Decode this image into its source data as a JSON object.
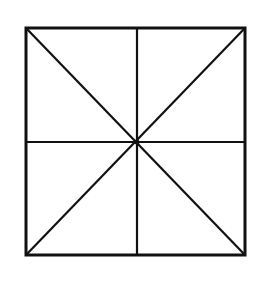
{
  "diagram": {
    "type": "geometric-figure",
    "stroke_color": "#111111",
    "background_color": "#ffffff",
    "square": {
      "x1": 26,
      "y1": 28,
      "x2": 245,
      "y2": 255
    },
    "center": {
      "x": 137,
      "y": 142
    },
    "lines": [
      {
        "name": "diagonal-tl-br",
        "x1": 26,
        "y1": 28,
        "x2": 245,
        "y2": 255
      },
      {
        "name": "diagonal-tr-bl",
        "x1": 245,
        "y1": 28,
        "x2": 26,
        "y2": 255
      },
      {
        "name": "vertical-midline",
        "x1": 137,
        "y1": 28,
        "x2": 137,
        "y2": 255
      },
      {
        "name": "horizontal-midline",
        "x1": 26,
        "y1": 142,
        "x2": 245,
        "y2": 142
      }
    ],
    "region_count": 8
  }
}
